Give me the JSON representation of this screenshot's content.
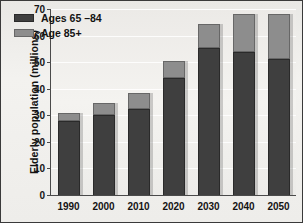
{
  "chart_data": {
    "type": "bar",
    "title": "",
    "subtitle": "",
    "xlabel": "",
    "ylabel": "Elderly population (millions)",
    "categories": [
      "1990",
      "2000",
      "2010",
      "2020",
      "2030",
      "2040",
      "2050"
    ],
    "series": [
      {
        "name": "Ages 65 –84",
        "color": "#3f3f3f",
        "values": [
          28,
          30,
          32.5,
          44,
          55.5,
          54,
          51
        ]
      },
      {
        "name": "Age 85+",
        "color": "#8d8d8d",
        "values": [
          3,
          4.5,
          6,
          6.5,
          9,
          14,
          17
        ]
      }
    ],
    "totals": [
      31,
      34.5,
      38.5,
      50.5,
      64.5,
      68,
      68
    ],
    "stacked": true,
    "ylim": [
      0,
      70
    ],
    "ytick_labels": [
      "0",
      "10",
      "20",
      "30",
      "40",
      "50",
      "60",
      "70"
    ],
    "ytick_values": [
      0,
      10,
      20,
      30,
      40,
      50,
      60,
      70
    ],
    "grid": true,
    "grid_axis": "y",
    "legend_position": "top-left"
  },
  "legend": {
    "items": [
      {
        "label": "Ages 65 –84",
        "swatch": "dark-swatch"
      },
      {
        "label": "Age 85+",
        "swatch": "light-swatch"
      }
    ]
  }
}
